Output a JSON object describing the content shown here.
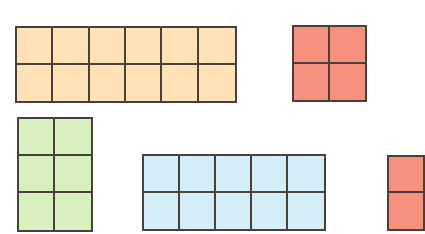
{
  "diagram": {
    "title": "",
    "arrays": [
      {
        "id": "orange-array",
        "rows": 2,
        "cols": 6,
        "color": "#fde2b8",
        "x": 15,
        "y": 26,
        "w": 222,
        "h": 77
      },
      {
        "id": "red-array",
        "rows": 2,
        "cols": 2,
        "color": "#f4907c",
        "x": 292,
        "y": 25,
        "w": 75,
        "h": 77
      },
      {
        "id": "green-array",
        "rows": 3,
        "cols": 2,
        "color": "#d8f0c0",
        "x": 17,
        "y": 117,
        "w": 76,
        "h": 115
      },
      {
        "id": "blue-array",
        "rows": 2,
        "cols": 5,
        "color": "#d2eef8",
        "x": 142,
        "y": 154,
        "w": 184,
        "h": 77
      },
      {
        "id": "red-array-partial",
        "rows": 2,
        "cols": 1,
        "color": "#f4907c",
        "x": 387,
        "y": 155,
        "w": 38,
        "h": 76
      }
    ]
  }
}
